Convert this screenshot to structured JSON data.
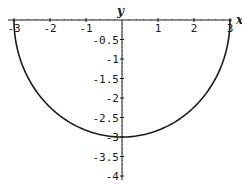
{
  "chart_data": {
    "type": "line",
    "title": "",
    "xlabel": "x",
    "ylabel": "y",
    "xlim": [
      -3,
      3
    ],
    "ylim": [
      -4,
      0
    ],
    "grid": false,
    "x_ticks": [
      -3,
      -2,
      -1,
      1,
      2,
      3
    ],
    "x_tick_labels": [
      "-3",
      "-2",
      "-1",
      "1",
      "2",
      "3"
    ],
    "y_ticks": [
      -0.5,
      -1,
      -1.5,
      -2,
      -2.5,
      -3,
      -3.5,
      -4
    ],
    "y_tick_labels": [
      "-0.5",
      "-1",
      "-1.5",
      "-2",
      "-2.5",
      "-3",
      "-3.5",
      "-4"
    ],
    "series": [
      {
        "name": "y = -sqrt(9 - x^2)",
        "x": [
          -3,
          -2.5,
          -2,
          -1.5,
          -1,
          -0.5,
          0,
          0.5,
          1,
          1.5,
          2,
          2.5,
          3
        ],
        "values": [
          0,
          -1.66,
          -2.24,
          -2.6,
          -2.83,
          -2.96,
          -3,
          -2.96,
          -2.83,
          -2.6,
          -2.24,
          -1.66,
          0
        ]
      }
    ]
  },
  "axes": {
    "x_label": "x",
    "y_label": "y"
  }
}
